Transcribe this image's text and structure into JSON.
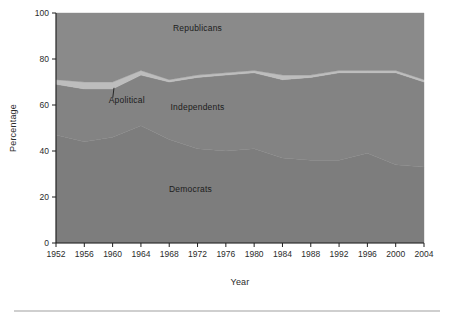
{
  "chart_data": {
    "type": "area",
    "stacked": true,
    "title": "",
    "xlabel": "Year",
    "ylabel": "Percentage",
    "xlim": [
      1952,
      2004
    ],
    "ylim": [
      0,
      100
    ],
    "grid": false,
    "legend_position": "inline-annotations",
    "x": [
      1952,
      1956,
      1960,
      1964,
      1968,
      1972,
      1976,
      1980,
      1984,
      1988,
      1992,
      1996,
      2000,
      2004
    ],
    "xtick_labels": [
      "1952",
      "1956",
      "1960",
      "1964",
      "1968",
      "1972",
      "1976",
      "1980",
      "1984",
      "1988",
      "1992",
      "1996",
      "2000",
      "2004"
    ],
    "ytick_labels": [
      "0",
      "20",
      "40",
      "60",
      "80",
      "100"
    ],
    "ytick_values": [
      0,
      20,
      40,
      60,
      80,
      100
    ],
    "series": [
      {
        "name": "Democrats",
        "color": "#7d7d7d",
        "values": [
          47,
          44,
          46,
          51,
          45,
          41,
          40,
          41,
          37,
          36,
          36,
          39,
          34,
          33
        ]
      },
      {
        "name": "Independents",
        "color": "#838383",
        "values": [
          22,
          23,
          21,
          22,
          25,
          31,
          33,
          33,
          34,
          36,
          38,
          35,
          40,
          37
        ]
      },
      {
        "name": "Apolitical",
        "color": "#bdbdbd",
        "values": [
          2,
          3,
          3,
          2,
          1,
          1,
          1,
          1,
          2,
          1,
          1,
          1,
          1,
          1
        ]
      },
      {
        "name": "Republicans",
        "color": "#8a8a8a",
        "values": [
          29,
          30,
          30,
          25,
          29,
          27,
          26,
          25,
          27,
          27,
          25,
          25,
          25,
          29
        ]
      }
    ],
    "annotations": [
      {
        "text": "Republicans",
        "x": 1972,
        "y": 92
      },
      {
        "text": "Apolitical",
        "x": 1962,
        "y": 61
      },
      {
        "text": "Independents",
        "x": 1972,
        "y": 58
      },
      {
        "text": "Democrats",
        "x": 1971,
        "y": 22
      }
    ]
  },
  "figure": {
    "ylabel": "Percentage",
    "xlabel": "Year",
    "background": "#ffffff",
    "axis_color": "#1f1f1f"
  }
}
